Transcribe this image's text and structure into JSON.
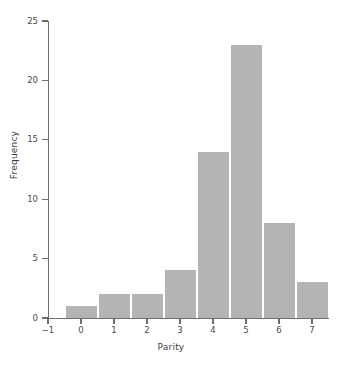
{
  "chart_data": {
    "type": "bar",
    "title": "",
    "subtitle": "",
    "xlabel": "Parity",
    "ylabel": "Frequency",
    "categories": [
      "0",
      "1",
      "2",
      "3",
      "4",
      "5",
      "6",
      "7"
    ],
    "values": [
      1,
      2,
      2,
      4,
      14,
      23,
      8,
      3
    ],
    "x": [
      0,
      1,
      2,
      3,
      4,
      5,
      6,
      7
    ],
    "bin_width": 1,
    "xlim": [
      -1,
      7.5
    ],
    "ylim": [
      0,
      25
    ],
    "xticks": [
      "−1",
      "0",
      "1",
      "2",
      "3",
      "4",
      "5",
      "6",
      "7"
    ],
    "xtick_values": [
      -1,
      0,
      1,
      2,
      3,
      4,
      5,
      6,
      7
    ],
    "yticks": [
      "0",
      "5",
      "10",
      "15",
      "20",
      "25"
    ],
    "ytick_values": [
      0,
      5,
      10,
      15,
      20,
      25
    ],
    "grid": false,
    "legend": null,
    "annotations": [],
    "colors": {
      "bar_fill": "#b4b4b4",
      "bar_edge": "#ffffff",
      "axis": "#6e6e6e",
      "text": "#3c3c3c",
      "background": "#ffffff"
    }
  }
}
